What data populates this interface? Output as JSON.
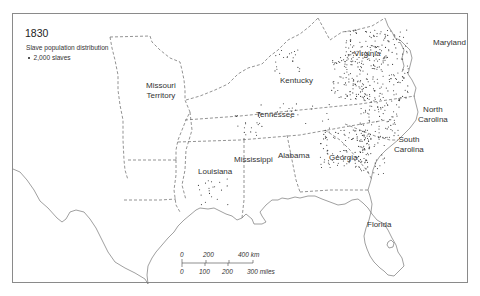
{
  "map": {
    "title": "1830",
    "legend": {
      "title": "Slave population distribution",
      "items": [
        {
          "symbol": "dot",
          "label": "2,000 slaves"
        }
      ]
    },
    "regions": [
      {
        "name": "Missouri Territory",
        "line1": "Missouri",
        "line2": "Territory"
      },
      {
        "name": "Kentucky",
        "line1": "Kentucky"
      },
      {
        "name": "Virginia",
        "line1": "Virginia"
      },
      {
        "name": "Maryland",
        "line1": "Maryland"
      },
      {
        "name": "Tennessee",
        "line1": "Tennessee"
      },
      {
        "name": "North Carolina",
        "line1": "North",
        "line2": "Carolina"
      },
      {
        "name": "South Carolina",
        "line1": "South",
        "line2": "Carolina"
      },
      {
        "name": "Georgia",
        "line1": "Georgia"
      },
      {
        "name": "Alabama",
        "line1": "Alabama"
      },
      {
        "name": "Mississippi",
        "line1": "Mississippi"
      },
      {
        "name": "Louisiana",
        "line1": "Louisiana"
      },
      {
        "name": "Florida",
        "line1": "Florida"
      }
    ],
    "scale_bar": {
      "km_ticks": [
        "0",
        "200",
        "400 km"
      ],
      "mile_ticks": [
        "0",
        "100",
        "200",
        "300 miles"
      ]
    },
    "colors": {
      "frame": "#8a8a8a",
      "coastline": "#777777",
      "boundary": "#666666",
      "dots": "#333333",
      "text": "#333333"
    }
  }
}
